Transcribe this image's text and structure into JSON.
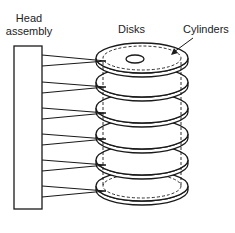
{
  "diagram": {
    "labels": {
      "head_assembly_line1": "Head",
      "head_assembly_line2": "assembly",
      "disks": "Disks",
      "cylinders": "Cylinders"
    },
    "disk_count": 6,
    "colors": {
      "stroke": "#1a1a1a",
      "background": "#ffffff"
    }
  }
}
